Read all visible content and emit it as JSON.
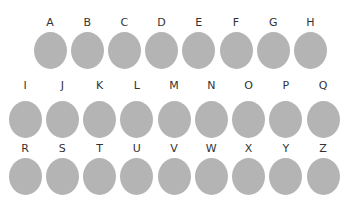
{
  "colors": {
    "circle": "#b4b4b4",
    "label": "#333333",
    "background": "#ffffff"
  },
  "rows": [
    {
      "label_y": 17,
      "circle_y": 32,
      "x0": 50,
      "dx": 37.2,
      "items": [
        "A",
        "B",
        "C",
        "D",
        "E",
        "F",
        "G",
        "H"
      ]
    },
    {
      "label_y": 80,
      "circle_y": 101,
      "x0": 25,
      "dx": 37.25,
      "items": [
        "I",
        "J",
        "K",
        "L",
        "M",
        "N",
        "O",
        "P",
        "Q"
      ]
    },
    {
      "label_y": 143,
      "circle_y": 158,
      "x0": 25,
      "dx": 37.25,
      "items": [
        "R",
        "S",
        "T",
        "U",
        "V",
        "W",
        "X",
        "Y",
        "Z"
      ]
    }
  ]
}
